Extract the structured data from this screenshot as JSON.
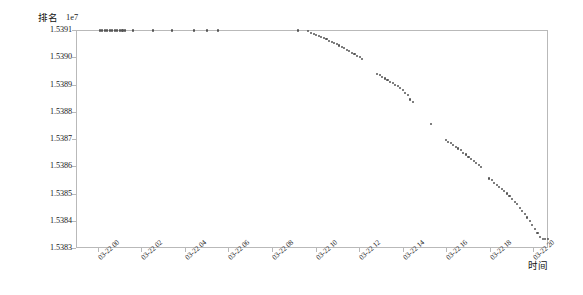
{
  "chart_data": {
    "type": "scatter",
    "title": "",
    "ylabel": "排名",
    "xlabel": "时间",
    "y_offset_text": "1e7",
    "y_scale": 10000000,
    "grid": false,
    "legend": null,
    "marker_color": "#555555",
    "axis_color": "#b9b9b9",
    "ylim": [
      15383000,
      15391000
    ],
    "ytick_labels": [
      "1.5391",
      "1.5390",
      "1.5389",
      "1.5388",
      "1.5387",
      "1.5386",
      "1.5385",
      "1.5384",
      "1.5383"
    ],
    "ytick_values": [
      15391000,
      15390000,
      15389000,
      15388000,
      15387000,
      15386000,
      15385000,
      15384000,
      15383000
    ],
    "xtick_labels": [
      "03-22 00",
      "03-22 02",
      "03-22 04",
      "03-22 06",
      "03-22 08",
      "03-22 10",
      "03-22 12",
      "03-22 14",
      "03-22 16",
      "03-22 18",
      "03-22 20"
    ],
    "xlim": [
      "03-21 23:00",
      "03-22 20:40"
    ],
    "series": [
      {
        "name": "排名",
        "points": [
          [
            "00:05",
            15390980
          ],
          [
            "00:12",
            15390980
          ],
          [
            "00:19",
            15390980
          ],
          [
            "00:26",
            15390980
          ],
          [
            "00:33",
            15390980
          ],
          [
            "00:40",
            15390980
          ],
          [
            "00:47",
            15390980
          ],
          [
            "00:54",
            15390980
          ],
          [
            "01:01",
            15390980
          ],
          [
            "01:08",
            15390980
          ],
          [
            "01:15",
            15390980
          ],
          [
            "01:38",
            15390980
          ],
          [
            "02:32",
            15390980
          ],
          [
            "03:25",
            15390980
          ],
          [
            "04:26",
            15390980
          ],
          [
            "05:02",
            15390980
          ],
          [
            "05:30",
            15390980
          ],
          [
            "09:12",
            15390980
          ],
          [
            "09:40",
            15390950
          ],
          [
            "09:48",
            15390900
          ],
          [
            "09:55",
            15390860
          ],
          [
            "10:02",
            15390820
          ],
          [
            "10:09",
            15390780
          ],
          [
            "10:16",
            15390730
          ],
          [
            "10:23",
            15390700
          ],
          [
            "10:30",
            15390660
          ],
          [
            "10:37",
            15390600
          ],
          [
            "10:44",
            15390560
          ],
          [
            "10:51",
            15390520
          ],
          [
            "10:58",
            15390480
          ],
          [
            "11:05",
            15390430
          ],
          [
            "11:12",
            15390380
          ],
          [
            "11:19",
            15390330
          ],
          [
            "11:26",
            15390280
          ],
          [
            "11:33",
            15390230
          ],
          [
            "11:40",
            15390170
          ],
          [
            "11:47",
            15390120
          ],
          [
            "11:54",
            15390060
          ],
          [
            "12:01",
            15390000
          ],
          [
            "12:08",
            15389950
          ],
          [
            "12:50",
            15389400
          ],
          [
            "12:57",
            15389340
          ],
          [
            "13:04",
            15389280
          ],
          [
            "13:11",
            15389220
          ],
          [
            "13:18",
            15389160
          ],
          [
            "13:25",
            15389100
          ],
          [
            "13:32",
            15389050
          ],
          [
            "13:39",
            15388990
          ],
          [
            "13:46",
            15388930
          ],
          [
            "13:53",
            15388870
          ],
          [
            "14:00",
            15388800
          ],
          [
            "14:07",
            15388700
          ],
          [
            "14:14",
            15388600
          ],
          [
            "14:21",
            15388450
          ],
          [
            "14:28",
            15388350
          ],
          [
            "15:18",
            15387550
          ],
          [
            "15:58",
            15386960
          ],
          [
            "16:05",
            15386900
          ],
          [
            "16:12",
            15386840
          ],
          [
            "16:19",
            15386780
          ],
          [
            "16:26",
            15386720
          ],
          [
            "16:33",
            15386650
          ],
          [
            "16:40",
            15386580
          ],
          [
            "16:47",
            15386500
          ],
          [
            "16:54",
            15386430
          ],
          [
            "17:01",
            15386350
          ],
          [
            "17:08",
            15386280
          ],
          [
            "17:15",
            15386200
          ],
          [
            "17:22",
            15386120
          ],
          [
            "17:29",
            15386040
          ],
          [
            "17:36",
            15385960
          ],
          [
            "17:58",
            15385550
          ],
          [
            "18:05",
            15385480
          ],
          [
            "18:12",
            15385400
          ],
          [
            "18:19",
            15385320
          ],
          [
            "18:26",
            15385240
          ],
          [
            "18:33",
            15385160
          ],
          [
            "18:40",
            15385080
          ],
          [
            "18:47",
            15385000
          ],
          [
            "18:54",
            15384900
          ],
          [
            "19:01",
            15384800
          ],
          [
            "19:08",
            15384700
          ],
          [
            "19:15",
            15384600
          ],
          [
            "19:22",
            15384480
          ],
          [
            "19:29",
            15384360
          ],
          [
            "19:36",
            15384240
          ],
          [
            "19:43",
            15384120
          ],
          [
            "19:50",
            15384000
          ],
          [
            "19:57",
            15383850
          ],
          [
            "20:04",
            15383700
          ],
          [
            "20:11",
            15383550
          ],
          [
            "20:18",
            15383400
          ],
          [
            "20:25",
            15383330
          ],
          [
            "20:32",
            15383330
          ],
          [
            "20:39",
            15383330
          ],
          [
            "20:46",
            15383330
          ],
          [
            "20:53",
            15383330
          ],
          [
            "21:00",
            15383330
          ]
        ]
      }
    ]
  }
}
